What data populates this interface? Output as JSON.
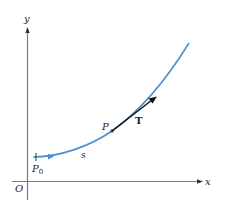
{
  "diagram": {
    "axes": {
      "x_label": "x",
      "y_label": "y",
      "origin_label": "O",
      "axis_color": "#7a7a7a"
    },
    "curve": {
      "color": "#4a90d0",
      "start_label": "P",
      "start_label_subscript": "0",
      "arc_length_label": "s"
    },
    "point": {
      "label": "P"
    },
    "tangent": {
      "label": "T",
      "color": "#111111"
    }
  }
}
